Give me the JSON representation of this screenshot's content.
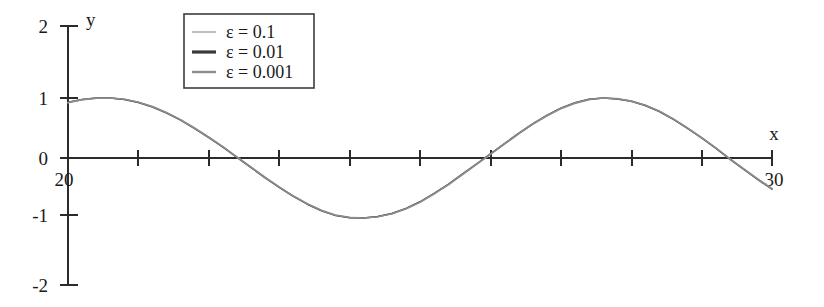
{
  "chart_data": {
    "type": "line",
    "title": "",
    "xlabel": "x",
    "ylabel": "y",
    "xlim": [
      20,
      30
    ],
    "ylim": [
      -2,
      2
    ],
    "grid": false,
    "legend_position": "top-center",
    "x_tick_labels": [
      "20",
      "30"
    ],
    "x_ticks_major": [
      20,
      21,
      22,
      23,
      24,
      25,
      26,
      27,
      28,
      29,
      30
    ],
    "y_tick_labels": [
      "2",
      "1",
      "0",
      "-1",
      "-2"
    ],
    "y_ticks": [
      2,
      1,
      0,
      -1,
      -2
    ],
    "annotations": [],
    "series": [
      {
        "name": "ε = 0.1",
        "color": "#b9b9b9",
        "width": 1.6,
        "legend_sample": "thin-light-line",
        "description": "slowly varying oscillation, amplitude ~1, period ~2π",
        "x": [
          20.0,
          20.2,
          20.4,
          20.6,
          20.8,
          21.0,
          21.2,
          21.4,
          21.6,
          21.8,
          22.0,
          22.2,
          22.4,
          22.6,
          22.8,
          23.0,
          23.2,
          23.4,
          23.6,
          23.8,
          24.0,
          24.2,
          24.4,
          24.6,
          24.8,
          25.0,
          25.2,
          25.4,
          25.6,
          25.8,
          26.0,
          26.2,
          26.4,
          26.6,
          26.8,
          27.0,
          27.2,
          27.4,
          27.6,
          27.8,
          28.0,
          28.2,
          28.4,
          28.6,
          28.8,
          29.0,
          29.2,
          29.4,
          29.6,
          29.8,
          30.0
        ],
        "y": [
          0.92,
          0.97,
          0.997,
          1.0,
          0.98,
          0.93,
          0.86,
          0.76,
          0.64,
          0.5,
          0.35,
          0.19,
          0.02,
          -0.15,
          -0.32,
          -0.48,
          -0.63,
          -0.76,
          -0.87,
          -0.95,
          -0.99,
          -1.0,
          -0.98,
          -0.93,
          -0.85,
          -0.74,
          -0.6,
          -0.45,
          -0.28,
          -0.11,
          0.06,
          0.23,
          0.4,
          0.56,
          0.7,
          0.82,
          0.91,
          0.97,
          1.0,
          0.99,
          0.95,
          0.88,
          0.78,
          0.65,
          0.5,
          0.34,
          0.17,
          -0.01,
          -0.18,
          -0.35,
          -0.51
        ]
      },
      {
        "name": "ε = 0.01",
        "color": "#3a3a3a",
        "width": 1.5,
        "legend_sample": "thick-dark-line",
        "description": "nearly coincident with other curves",
        "x": [
          20.0,
          20.2,
          20.4,
          20.6,
          20.8,
          21.0,
          21.2,
          21.4,
          21.6,
          21.8,
          22.0,
          22.2,
          22.4,
          22.6,
          22.8,
          23.0,
          23.2,
          23.4,
          23.6,
          23.8,
          24.0,
          24.2,
          24.4,
          24.6,
          24.8,
          25.0,
          25.2,
          25.4,
          25.6,
          25.8,
          26.0,
          26.2,
          26.4,
          26.6,
          26.8,
          27.0,
          27.2,
          27.4,
          27.6,
          27.8,
          28.0,
          28.2,
          28.4,
          28.6,
          28.8,
          29.0,
          29.2,
          29.4,
          29.6,
          29.8,
          30.0
        ],
        "y": [
          0.93,
          0.975,
          0.998,
          1.0,
          0.975,
          0.925,
          0.85,
          0.75,
          0.63,
          0.49,
          0.34,
          0.18,
          0.01,
          -0.16,
          -0.33,
          -0.49,
          -0.64,
          -0.77,
          -0.88,
          -0.96,
          -0.995,
          -1.0,
          -0.975,
          -0.925,
          -0.84,
          -0.73,
          -0.59,
          -0.44,
          -0.27,
          -0.1,
          0.07,
          0.24,
          0.41,
          0.57,
          0.71,
          0.83,
          0.92,
          0.98,
          1.0,
          0.985,
          0.945,
          0.875,
          0.775,
          0.645,
          0.495,
          0.335,
          0.165,
          -0.02,
          -0.19,
          -0.36,
          -0.52
        ]
      },
      {
        "name": "ε = 0.001",
        "color": "#8c8c8c",
        "width": 1.6,
        "legend_sample": "medium-gray-line",
        "description": "nearly coincident with other curves",
        "x": [
          20.0,
          20.2,
          20.4,
          20.6,
          20.8,
          21.0,
          21.2,
          21.4,
          21.6,
          21.8,
          22.0,
          22.2,
          22.4,
          22.6,
          22.8,
          23.0,
          23.2,
          23.4,
          23.6,
          23.8,
          24.0,
          24.2,
          24.4,
          24.6,
          24.8,
          25.0,
          25.2,
          25.4,
          25.6,
          25.8,
          26.0,
          26.2,
          26.4,
          26.6,
          26.8,
          27.0,
          27.2,
          27.4,
          27.6,
          27.8,
          28.0,
          28.2,
          28.4,
          28.6,
          28.8,
          29.0,
          29.2,
          29.4,
          29.6,
          29.8,
          30.0
        ],
        "y": [
          0.925,
          0.973,
          0.998,
          1.0,
          0.978,
          0.928,
          0.855,
          0.755,
          0.635,
          0.495,
          0.345,
          0.185,
          0.015,
          -0.155,
          -0.325,
          -0.485,
          -0.635,
          -0.765,
          -0.875,
          -0.955,
          -0.993,
          -1.0,
          -0.978,
          -0.928,
          -0.845,
          -0.735,
          -0.595,
          -0.445,
          -0.275,
          -0.105,
          0.065,
          0.235,
          0.405,
          0.565,
          0.705,
          0.825,
          0.915,
          0.975,
          1.0,
          0.988,
          0.948,
          0.878,
          0.778,
          0.648,
          0.498,
          0.338,
          0.168,
          -0.015,
          -0.185,
          -0.355,
          -0.515
        ]
      }
    ]
  },
  "axes": {
    "x_axis_name": "x",
    "y_axis_name": "y",
    "x_start_label": "20",
    "x_end_label": "30",
    "y_labels": [
      "2",
      "1",
      "0",
      "-1",
      "-2"
    ]
  },
  "legend": {
    "entries": [
      {
        "label": "ε = 0.1"
      },
      {
        "label": "ε = 0.01"
      },
      {
        "label": "ε = 0.001"
      }
    ]
  },
  "colors": {
    "axis": "#2b2b2b",
    "text": "#1a1a1a",
    "legend_border": "#3c3c3c",
    "background": "#ffffff",
    "series_1": "#b9b9b9",
    "series_2": "#3a3a3a",
    "series_3": "#8c8c8c"
  }
}
